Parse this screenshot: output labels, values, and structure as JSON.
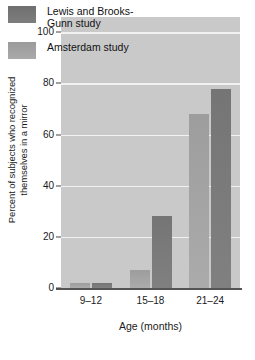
{
  "chart_data": {
    "type": "bar",
    "title": "",
    "xlabel": "Age (months)",
    "ylabel_line1": "Percent of subjects who recognized",
    "ylabel_line2": "themselves in a mirror",
    "categories": [
      "9–12",
      "15–18",
      "21–24"
    ],
    "series": [
      {
        "name": "Amsterdam study",
        "values": [
          2,
          7,
          68
        ],
        "color": "#a5a5a5"
      },
      {
        "name": "Lewis and Brooks-Gunn study",
        "values": [
          2,
          28,
          78
        ],
        "color": "#7a7a7a"
      }
    ],
    "legend_order": [
      "Lewis and Brooks-Gunn study",
      "Amsterdam study"
    ],
    "legend_position": "top-left-inside",
    "ylim": [
      0,
      106
    ],
    "yticks": [
      0,
      20,
      40,
      60,
      80,
      100
    ],
    "ytick_labels": [
      "0",
      "20",
      "40",
      "60",
      "80",
      "100"
    ],
    "grid": "horizontal-white",
    "plot_background": "#c9c9c9"
  },
  "legend": {
    "entries": [
      {
        "label_line1": "Lewis and Brooks-",
        "label_line2": "Gunn study",
        "swatch": "s1"
      },
      {
        "label_line1": "Amsterdam study",
        "label_line2": "",
        "swatch": "s0"
      }
    ]
  }
}
